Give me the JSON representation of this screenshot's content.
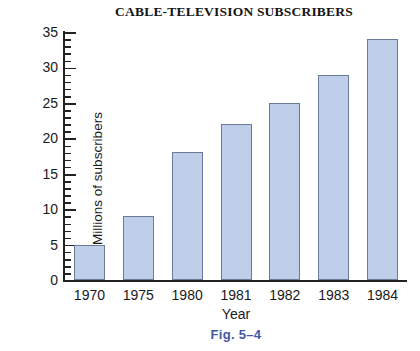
{
  "chart_data": {
    "type": "bar",
    "title": "CABLE-TELEVISION SUBSCRIBERS",
    "xlabel": "Year",
    "ylabel": "Millions of subscribers",
    "categories": [
      "1970",
      "1975",
      "1980",
      "1981",
      "1982",
      "1983",
      "1984"
    ],
    "values": [
      5,
      9,
      18,
      22,
      25,
      29,
      34
    ],
    "ylim": [
      0,
      35
    ],
    "ytick_labels": [
      "0",
      "5",
      "10",
      "15",
      "20",
      "25",
      "30",
      "35"
    ],
    "ytick_values": [
      0,
      5,
      10,
      15,
      20,
      25,
      30,
      35
    ],
    "y_minor_tick_interval": 1,
    "grid": false,
    "legend": null,
    "bar_fill_color": "#bfcfea",
    "bar_border_color": "#6a7a99",
    "axis_color": "#222222"
  },
  "caption": {
    "text": "Fig. 5–4",
    "color": "#3f5aa6"
  }
}
